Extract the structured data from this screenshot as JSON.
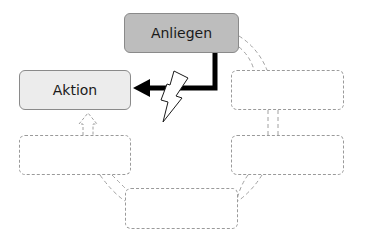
{
  "diagram": {
    "type": "cycle",
    "nodes": [
      {
        "id": "anliegen",
        "label": "Anliegen",
        "style": "solid",
        "fill": "#bdbdbd",
        "x": 124,
        "y": 13,
        "w": 115,
        "h": 40
      },
      {
        "id": "aktion",
        "label": "Aktion",
        "style": "solid",
        "fill": "#ececec",
        "x": 19,
        "y": 70,
        "w": 112,
        "h": 40
      },
      {
        "id": "right-top",
        "label": "",
        "style": "dashed",
        "x": 231,
        "y": 70,
        "w": 113,
        "h": 40
      },
      {
        "id": "right-bottom",
        "label": "",
        "style": "dashed",
        "x": 231,
        "y": 135,
        "w": 113,
        "h": 40
      },
      {
        "id": "bottom",
        "label": "",
        "style": "dashed",
        "x": 125,
        "y": 188,
        "w": 113,
        "h": 41
      },
      {
        "id": "left-bottom",
        "label": "",
        "style": "dashed",
        "x": 19,
        "y": 135,
        "w": 112,
        "h": 40
      }
    ],
    "edges": [
      {
        "from": "anliegen",
        "to": "aktion",
        "style": "thick-black-arrow",
        "interrupted_by": "lightning-bolt"
      },
      {
        "from": "anliegen",
        "to": "right-top",
        "style": "dashed-double"
      },
      {
        "from": "right-top",
        "to": "right-bottom",
        "style": "dashed-double"
      },
      {
        "from": "right-bottom",
        "to": "bottom",
        "style": "dashed-double"
      },
      {
        "from": "bottom",
        "to": "left-bottom",
        "style": "dashed-double"
      },
      {
        "from": "left-bottom",
        "to": "aktion",
        "style": "dashed-arrow"
      }
    ],
    "colors": {
      "anliegen_fill": "#bdbdbd",
      "aktion_fill": "#ececec",
      "border": "#8a8a8a",
      "dashed": "#9a9a9a",
      "arrow": "#000000"
    }
  }
}
